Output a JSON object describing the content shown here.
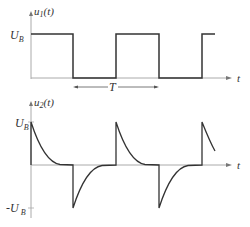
{
  "top_plot": {
    "ylabel_main": "u",
    "ylabel_sub": "1",
    "ylabel_arg": "(t)",
    "y_level_label_main": "U",
    "y_level_label_sub": "B",
    "xlabel": "t",
    "period_label": "T"
  },
  "bottom_plot": {
    "ylabel_main": "u",
    "ylabel_sub": "2",
    "ylabel_arg": "(t)",
    "pos_level_label_main": "U",
    "pos_level_label_sub": "B",
    "neg_level_label_main": "-U",
    "neg_level_label_sub": "B",
    "xlabel": "t"
  },
  "colors": {
    "signal": "#333333",
    "axis": "#999999"
  }
}
